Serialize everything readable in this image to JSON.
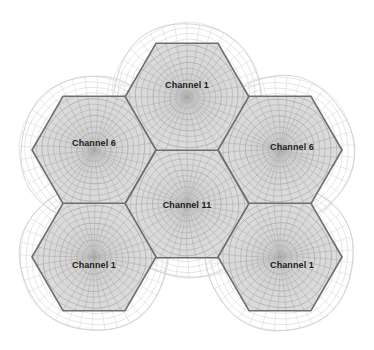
{
  "diagram": {
    "type": "hexagonal-cell-cluster",
    "background_color": "#ffffff",
    "canvas": {
      "width": 374,
      "height": 350
    },
    "style": {
      "hex_fill_color": "#dcdcdc",
      "hex_border_color": "#6e6e6e",
      "inner_grid_color": "#a8a8a8",
      "outer_grid_color": "#d2d2d2",
      "outer_circle_color": "#c9c9c9",
      "label_color": "#1b1b1b",
      "label_font_size": 9
    },
    "geometry": {
      "hex_radius": 62,
      "coverage_radius": 74,
      "grid_rings": 13,
      "grid_spokes": 36
    },
    "cells": [
      {
        "id": "cell-top-center",
        "label": "Channel 1",
        "channel": 1,
        "center": {
          "x": 187,
          "y": 97
        },
        "label_pos": {
          "x": 187,
          "y": 85
        }
      },
      {
        "id": "cell-middle-left",
        "label": "Channel 6",
        "channel": 6,
        "center": {
          "x": 94,
          "y": 150
        },
        "label_pos": {
          "x": 94,
          "y": 143
        }
      },
      {
        "id": "cell-middle-right",
        "label": "Channel 6",
        "channel": 6,
        "center": {
          "x": 280,
          "y": 150
        },
        "label_pos": {
          "x": 292,
          "y": 147
        }
      },
      {
        "id": "cell-center",
        "label": "Channel 11",
        "channel": 11,
        "center": {
          "x": 187,
          "y": 204
        },
        "label_pos": {
          "x": 187,
          "y": 205
        }
      },
      {
        "id": "cell-bottom-left",
        "label": "Channel 1",
        "channel": 1,
        "center": {
          "x": 94,
          "y": 257
        },
        "label_pos": {
          "x": 94,
          "y": 265
        }
      },
      {
        "id": "cell-bottom-right",
        "label": "Channel 1",
        "channel": 1,
        "center": {
          "x": 280,
          "y": 257
        },
        "label_pos": {
          "x": 292,
          "y": 265
        }
      }
    ]
  }
}
